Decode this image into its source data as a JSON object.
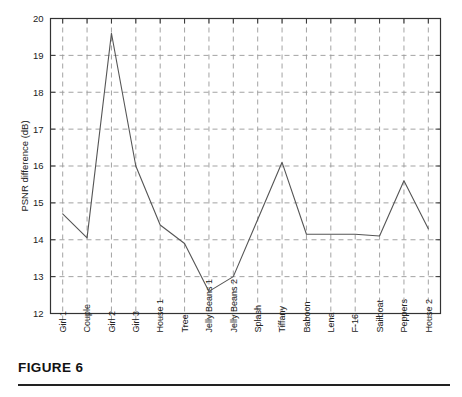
{
  "figure": {
    "caption_label": "FIGURE 6"
  },
  "chart_data": {
    "type": "line",
    "title": "",
    "subtitle": "",
    "xlabel": "",
    "ylabel": "PSNR difference (dB)",
    "categories": [
      "Girl 1",
      "Couple",
      "Girl 2",
      "Girl 3",
      "House 1",
      "Tree",
      "Jelly Beans 1",
      "Jelly Beans 2",
      "Splash",
      "Tiffany",
      "Baboon",
      "Lena",
      "F-16",
      "Sailboat",
      "Peppers",
      "House 2"
    ],
    "values": [
      14.7,
      14.05,
      19.6,
      16.0,
      14.4,
      13.9,
      12.6,
      13.0,
      14.55,
      16.1,
      14.15,
      14.15,
      14.15,
      14.1,
      15.6,
      14.3
    ],
    "series": [
      {
        "name": "PSNR difference",
        "values": [
          14.7,
          14.05,
          19.6,
          16.0,
          14.4,
          13.9,
          12.6,
          13.0,
          14.55,
          16.1,
          14.15,
          14.15,
          14.15,
          14.1,
          15.6,
          14.3
        ]
      }
    ],
    "ylim": [
      12,
      20
    ],
    "ytick_labels": [
      "12",
      "13",
      "14",
      "15",
      "16",
      "17",
      "18",
      "19",
      "20"
    ],
    "yticks": [
      12,
      13,
      14,
      15,
      16,
      17,
      18,
      19,
      20
    ],
    "grid": "dashed-both",
    "legend": "none",
    "line_color": "#555555",
    "grid_color": "#999999",
    "axis_color": "#333333"
  }
}
